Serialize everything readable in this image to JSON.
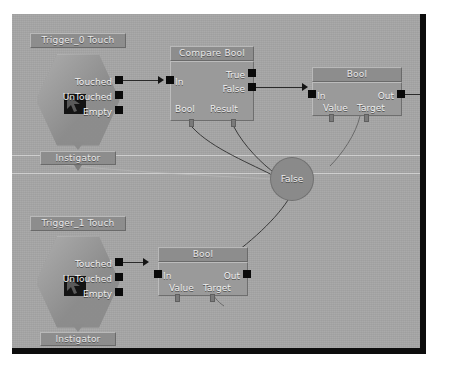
{
  "canvas": {
    "background_color": "#a6a6a6",
    "frame_color": "#0d0d0d"
  },
  "nodes": [
    {
      "id": "trigger0",
      "type": "event-hexagon",
      "title": "Trigger_0 Touch",
      "footer": "Instigator",
      "outputs": [
        "Touched",
        "UnTouched",
        "Empty"
      ]
    },
    {
      "id": "compare_bool",
      "type": "box",
      "title": "Compare Bool",
      "inputs": [
        "In",
        "Bool"
      ],
      "outputs": [
        "True",
        "False",
        "Result"
      ]
    },
    {
      "id": "bool_top",
      "type": "box",
      "title": "Bool",
      "inputs": [
        "In",
        "Value"
      ],
      "outputs": [
        "Out",
        "Target"
      ]
    },
    {
      "id": "false_value",
      "type": "oval",
      "title": "False"
    },
    {
      "id": "trigger1",
      "type": "event-hexagon",
      "title": "Trigger_1 Touch",
      "footer": "Instigator",
      "outputs": [
        "Touched",
        "UnTouched",
        "Empty"
      ]
    },
    {
      "id": "bool_bottom",
      "type": "box",
      "title": "Bool",
      "inputs": [
        "In",
        "Value"
      ],
      "outputs": [
        "Out",
        "Target"
      ]
    }
  ],
  "labels": {
    "trigger0_title": "Trigger_0 Touch",
    "trigger0_touched": "Touched",
    "trigger0_untouched": "UnTouched",
    "trigger0_empty": "Empty",
    "trigger0_instigator": "Instigator",
    "compare_title": "Compare Bool",
    "compare_in": "In",
    "compare_true": "True",
    "compare_false": "False",
    "compare_bool": "Bool",
    "compare_result": "Result",
    "bool_top_title": "Bool",
    "bool_top_in": "In",
    "bool_top_out": "Out",
    "bool_top_value": "Value",
    "bool_top_target": "Target",
    "false_node": "False",
    "trigger1_title": "Trigger_1 Touch",
    "trigger1_touched": "Touched",
    "trigger1_untouched": "UnTouched",
    "trigger1_empty": "Empty",
    "trigger1_instigator": "Instigator",
    "bool_bottom_title": "Bool",
    "bool_bottom_in": "In",
    "bool_bottom_out": "Out",
    "bool_bottom_value": "Value",
    "bool_bottom_target": "Target"
  }
}
